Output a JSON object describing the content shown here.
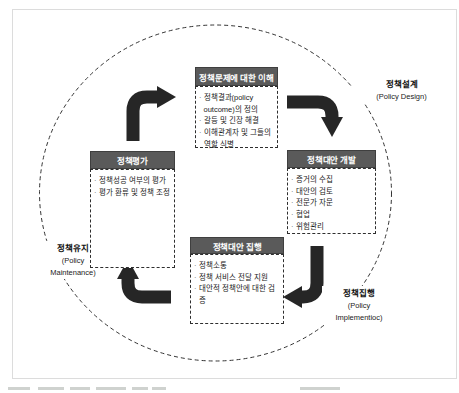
{
  "cycle": {
    "bullet_char": "·",
    "nodes": [
      {
        "header": "정책문제에 대한 이해",
        "items": [
          "정책결과(policy outcome)의 정의",
          "갈등 및 긴장 해결",
          "이해관계자 및 그들의 역할 식별"
        ]
      },
      {
        "header": "정책대안 개발",
        "items": [
          "증거의 수집",
          "대안의 검토",
          "전문가 자문",
          "협업",
          "위험관리"
        ]
      },
      {
        "header": "정책대안 집행",
        "items": [
          "정책소통",
          "정책 서비스 전달 지원",
          "대안적 정책안에 대한 검증"
        ]
      },
      {
        "header": "정책평가",
        "items": [
          "정책성공 여부의 평가",
          "평가 환류 및 정책 조정"
        ]
      }
    ],
    "outer_labels": [
      {
        "ko": "정책설계",
        "en_line1": "(Policy Design)"
      },
      {
        "ko": "정책집행",
        "en_line1": "(Policy",
        "en_line2": "Implementioc)"
      },
      {
        "ko": "정책유지",
        "en_line1": "(Policy",
        "en_line2": "Maintenance)"
      }
    ],
    "colors": {
      "node_header_bg": "#5a5a5a",
      "node_header_text": "#ffffff",
      "arrow": "#262626",
      "dashed_line": "#333333",
      "frame_border": "#dcdcdc"
    }
  }
}
